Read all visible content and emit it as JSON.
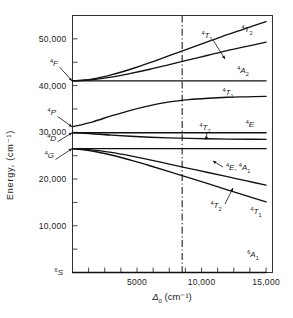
{
  "figure": {
    "name": "energy-level-diagram",
    "yaxis": {
      "title": "Energy, (cm⁻¹)",
      "ticks": [
        "50,000",
        "40,000",
        "30,000",
        "20,000",
        "10,000"
      ],
      "tick_values": [
        50000,
        40000,
        30000,
        20000,
        10000
      ],
      "range": [
        0,
        55000
      ]
    },
    "xaxis": {
      "title_delta": "Δ",
      "title_sub": "0",
      "title_units": "(cm⁻¹)",
      "title_full": "Δ0 (cm⁻¹)",
      "ticks": [
        "5000",
        "10,000",
        "15,000"
      ],
      "tick_values": [
        5000,
        10000,
        15000
      ],
      "range": [
        0,
        15500
      ]
    },
    "marker_line": {
      "name": "dash-dot-marker",
      "x_value": 8500,
      "style": "dash-dot"
    },
    "free_ion_terms": [
      {
        "label_sup": "4",
        "label_term": "F",
        "energy": 41000,
        "name": "free-ion-4F"
      },
      {
        "label_sup": "4",
        "label_term": "P",
        "energy": 31200,
        "name": "free-ion-4P"
      },
      {
        "label_sup": "4",
        "label_term": "D",
        "energy": 29900,
        "name": "free-ion-4D"
      },
      {
        "label_sup": "4",
        "label_term": "G",
        "energy": 26500,
        "name": "free-ion-4G"
      },
      {
        "label_sup": "6",
        "label_term": "S",
        "energy": 0,
        "name": "free-ion-6S"
      }
    ],
    "curve_labels": [
      {
        "text": "⁴T₁",
        "sup": "4",
        "term": "T",
        "sub": "1",
        "name": "label-4T1-upper",
        "x": 207,
        "y": 38,
        "arrow": true
      },
      {
        "text": "⁴T₂",
        "sup": "4",
        "term": "T",
        "sub": "2",
        "name": "label-4T2-upper",
        "x": 247,
        "y": 32,
        "arrow": false
      },
      {
        "text": "⁴A₂",
        "sup": "4",
        "term": "A",
        "sub": "2",
        "name": "label-4A2",
        "x": 243,
        "y": 73,
        "arrow": false
      },
      {
        "text": "⁴T₁",
        "sup": "4",
        "term": "T",
        "sub": "1",
        "name": "label-4T1-middle",
        "x": 228,
        "y": 95,
        "arrow": false
      },
      {
        "text": "⁴T₂",
        "sup": "4",
        "term": "T",
        "sub": "2",
        "name": "label-4T2-middle",
        "x": 205,
        "y": 130,
        "arrow": true
      },
      {
        "text": "⁴E",
        "sup": "4",
        "term": "E",
        "sub": "",
        "name": "label-4E-middle",
        "x": 250,
        "y": 127,
        "arrow": false
      },
      {
        "text": "⁴E, ⁴A₁",
        "sup": "4",
        "term": "E",
        "sub": "",
        "name": "label-4E-4A1",
        "x": 226,
        "y": 170,
        "arrow": true
      },
      {
        "text": "⁴T₂",
        "sup": "4",
        "term": "T",
        "sub": "2",
        "name": "label-4T2-lower",
        "x": 216,
        "y": 208,
        "arrow": true
      },
      {
        "text": "⁴T₁",
        "sup": "4",
        "term": "T",
        "sub": "1",
        "name": "label-4T1-lower",
        "x": 256,
        "y": 214,
        "arrow": false
      },
      {
        "text": "⁶A₁",
        "sup": "6",
        "term": "A",
        "sub": "1",
        "name": "label-6A1",
        "x": 253,
        "y": 257,
        "arrow": false
      }
    ]
  },
  "chart_data": {
    "type": "line",
    "title": "",
    "xlabel": "Δ0 (cm⁻¹)",
    "ylabel": "Energy, (cm⁻¹)",
    "xlim": [
      0,
      15500
    ],
    "ylim": [
      0,
      55000
    ],
    "grid": false,
    "legend": "none (inline curve labels)",
    "x": [
      0,
      1500,
      3000,
      4500,
      6000,
      7500,
      9000,
      10500,
      12000,
      13500,
      15000
    ],
    "series": [
      {
        "name": "⁴T₂ (from ⁴F)",
        "label": "4T2-upper",
        "values": [
          41000,
          41400,
          42300,
          43500,
          44900,
          46400,
          47900,
          49400,
          50900,
          52300,
          53700
        ]
      },
      {
        "name": "⁴T₁ (from ⁴F)",
        "label": "4T1-upper",
        "values": [
          41000,
          41250,
          41800,
          42600,
          43500,
          44500,
          45500,
          46500,
          47500,
          48400,
          49300
        ]
      },
      {
        "name": "⁴A₂ (from ⁴F)",
        "label": "4A2",
        "values": [
          41000,
          41000,
          41000,
          41000,
          41000,
          41000,
          41000,
          41000,
          41000,
          41000,
          41000
        ]
      },
      {
        "name": "⁴T₁ (from ⁴P)",
        "label": "4T1-middle",
        "values": [
          31200,
          32200,
          33500,
          34700,
          35700,
          36500,
          37000,
          37300,
          37500,
          37600,
          37700
        ]
      },
      {
        "name": "⁴E (from ⁴D)",
        "label": "4E-middle",
        "values": [
          29900,
          29900,
          29900,
          29900,
          29900,
          29900,
          29900,
          29900,
          29900,
          29900,
          29900
        ]
      },
      {
        "name": "⁴T₂ (from ⁴D)",
        "label": "4T2-middle",
        "values": [
          29900,
          29700,
          29400,
          29150,
          28950,
          28800,
          28700,
          28620,
          28560,
          28520,
          28500
        ]
      },
      {
        "name": "⁴E, ⁴A₁ (from ⁴G)",
        "label": "4E-4A1",
        "values": [
          26500,
          26500,
          26500,
          26500,
          26500,
          26500,
          26500,
          26500,
          26500,
          26500,
          26500
        ]
      },
      {
        "name": "⁴T₂ (from ⁴G)",
        "label": "4T2-lower",
        "values": [
          26500,
          26250,
          25700,
          24950,
          24100,
          23200,
          22300,
          21400,
          20500,
          19600,
          18700
        ]
      },
      {
        "name": "⁴T₁ (from ⁴G)",
        "label": "4T1-lower",
        "values": [
          26500,
          26000,
          25150,
          24050,
          22850,
          21600,
          20300,
          19000,
          17700,
          16400,
          15100
        ]
      },
      {
        "name": "⁶A₁ (ground, from ⁶S)",
        "label": "6A1",
        "values": [
          0,
          0,
          0,
          0,
          0,
          0,
          0,
          0,
          0,
          0,
          0
        ]
      }
    ]
  }
}
